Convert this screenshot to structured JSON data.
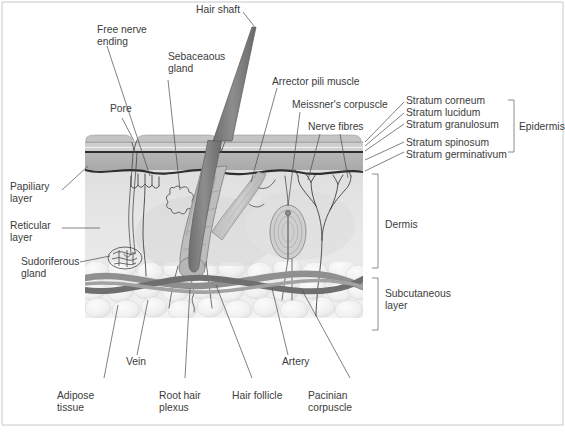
{
  "figure": {
    "background_color": "#ffffff"
  },
  "labels": {
    "hair_shaft": "Hair shaft",
    "free_nerve_ending": "Free nerve",
    "free_nerve_ending_2": "ending",
    "sebaceous_gland": "Sebaceaous",
    "sebaceous_gland_2": "gland",
    "pore": "Pore",
    "arrector_pili": "Arrector pili muscle",
    "meissners_corpuscle": "Meissner's corpuscle",
    "nerve_fibres": "Nerve fibres",
    "stratum_corneum": "Stratum corneum",
    "stratum_lucidum": "Stratum lucidum",
    "stratum_granulosum": "Stratum granulosum",
    "stratum_spinosum": "Stratum spinosum",
    "stratum_germinativum": "Stratum germinativum",
    "epidermis": "Epidermis",
    "papillary_layer": "Papiliary",
    "papillary_layer_2": "layer",
    "reticular_layer": "Reticular",
    "reticular_layer_2": "layer",
    "sudoriferous_gland": "Sudoriferous",
    "sudoriferous_gland_2": "gland",
    "dermis": "Dermis",
    "subcutaneous_layer": "Subcutaneous",
    "subcutaneous_layer_2": "layer",
    "vein": "Vein",
    "artery": "Artery",
    "adipose_tissue": "Adipose",
    "adipose_tissue_2": "tissue",
    "root_hair_plexus": "Root hair",
    "root_hair_plexus_2": "plexus",
    "hair_follicle": "Hair follicle",
    "pacinian_corpuscle": "Pacinian",
    "pacinian_corpuscle_2": "corpuscle"
  },
  "colors": {
    "text": "#3c3c3c",
    "leader": "#4a4a4a",
    "bracket": "#6e6e6e",
    "epidermis_top": "#cfcfcf",
    "epidermis_band": "#b0b0b0",
    "dermis": "#e3e3e3",
    "subcutaneous": "#ededed",
    "hair": "#8a8a8a",
    "vessel_dark": "#7a7a7a",
    "vessel_light": "#9a9a9a",
    "frame": "#c8c8c8"
  },
  "structures": [
    "hair shaft",
    "hair follicle",
    "sebaceous gland",
    "arrector pili muscle",
    "sudoriferous gland",
    "pacinian corpuscle",
    "meissner's corpuscle",
    "free nerve ending",
    "nerve fibres",
    "root hair plexus",
    "vein",
    "artery",
    "adipose tissue"
  ]
}
